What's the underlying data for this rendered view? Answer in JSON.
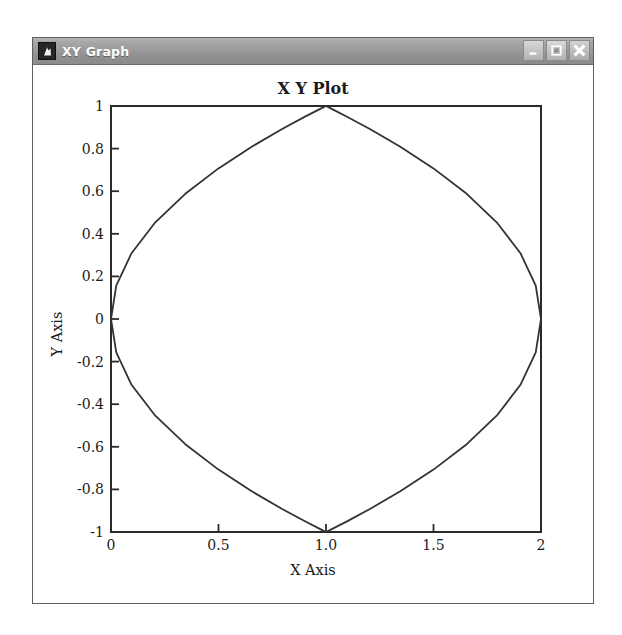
{
  "window": {
    "title": "XY Graph",
    "icon": "app-icon",
    "buttons": [
      {
        "name": "minimize",
        "label": "Minimize"
      },
      {
        "name": "maximize",
        "label": "Maximize"
      },
      {
        "name": "close",
        "label": "Close"
      }
    ]
  },
  "chart_data": {
    "type": "line",
    "title": "X Y Plot",
    "xlabel": "X Axis",
    "ylabel": "Y Axis",
    "xlim": [
      0,
      2
    ],
    "ylim": [
      -1,
      1
    ],
    "xticks": [
      0,
      0.5,
      1,
      1.5,
      2
    ],
    "xtick_labels": [
      "0",
      "0.5",
      "1.0",
      "1.5",
      "2"
    ],
    "yticks": [
      -1,
      -0.8,
      -0.6,
      -0.4,
      -0.2,
      0,
      0.2,
      0.4,
      0.6,
      0.8,
      1
    ],
    "ytick_labels": [
      "-1",
      "-0.8",
      "-0.6",
      "-0.4",
      "-0.2",
      "0",
      "0.2",
      "0.4",
      "0.6",
      "0.8",
      "1"
    ],
    "grid": false,
    "legend": "none",
    "line_color": "#333333",
    "line_width": 1.8,
    "series": [
      {
        "name": "circle",
        "description": "Unit circle centered at (1, 0)",
        "x": [
          1.0,
          0.9755,
          0.9045,
          0.7939,
          0.6545,
          0.5,
          0.3455,
          0.2061,
          0.0955,
          0.0245,
          0.0,
          0.0245,
          0.0955,
          0.2061,
          0.3455,
          0.5,
          0.6545,
          0.7939,
          0.9045,
          0.9755,
          1.0,
          1.0245,
          1.0955,
          1.2061,
          1.3455,
          1.5,
          1.6545,
          1.7939,
          1.9045,
          1.9755,
          2.0,
          1.9755,
          1.9045,
          1.7939,
          1.6545,
          1.5,
          1.3455,
          1.2061,
          1.0955,
          1.0245,
          1.0
        ],
        "y": [
          1.0,
          0.9877,
          0.9511,
          0.891,
          0.809,
          0.7071,
          0.5878,
          0.454,
          0.309,
          0.1564,
          0.0,
          -0.1564,
          -0.309,
          -0.454,
          -0.5878,
          -0.7071,
          -0.809,
          -0.891,
          -0.9511,
          -0.9877,
          -1.0,
          -0.9877,
          -0.9511,
          -0.891,
          -0.809,
          -0.7071,
          -0.5878,
          -0.454,
          -0.309,
          -0.1564,
          0.0,
          0.1564,
          0.309,
          0.454,
          0.5878,
          0.7071,
          0.809,
          0.891,
          0.9511,
          0.9877,
          1.0
        ]
      }
    ]
  }
}
